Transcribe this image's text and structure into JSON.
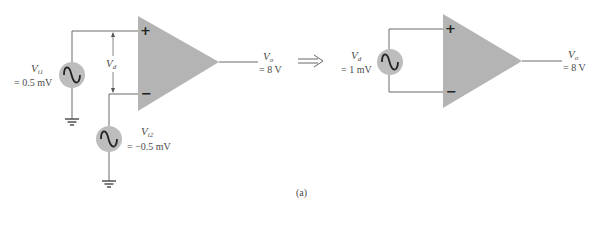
{
  "figure": {
    "caption": "(a)",
    "colors": {
      "opamp_fill": "#b4b4b4",
      "source_fill": "#bdbdbd",
      "wire": "#6a6a6a",
      "text": "#4a4a4a"
    }
  },
  "left_circuit": {
    "source_1": {
      "name": "V",
      "subscript": "i1",
      "value": "= 0.5 mV"
    },
    "source_2": {
      "name": "V",
      "subscript": "i2",
      "value": "= −0.5 mV"
    },
    "differential": {
      "name": "V",
      "subscript": "d"
    },
    "opamp": {
      "plus": "+",
      "minus": "−"
    },
    "output": {
      "name": "V",
      "subscript": "o",
      "value": "= 8 V"
    }
  },
  "equivalence_arrow": "⟹",
  "right_circuit": {
    "source": {
      "name": "V",
      "subscript": "d",
      "value": "= 1 mV"
    },
    "opamp": {
      "plus": "+",
      "minus": "−"
    },
    "output": {
      "name": "V",
      "subscript": "o",
      "value": "= 8 V"
    }
  }
}
